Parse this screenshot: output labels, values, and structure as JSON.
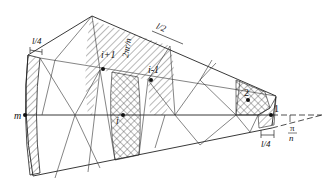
{
  "diagram": {
    "type": "sector-mesh",
    "colors": {
      "line": "#222222",
      "background": "#ffffff"
    },
    "labels": {
      "m": "m",
      "i_plus_1": "i+1",
      "i": "i",
      "i_minus_1": "i-1",
      "two": "2",
      "one": "1",
      "width_l4_left": "l/4",
      "width_l2_top": "l/2",
      "width_l4_bottom": "l/4",
      "arc_length": "2πr/n",
      "angle_num": "π",
      "angle_den": "n"
    },
    "nodes": [
      {
        "id": "m",
        "x": 25,
        "y": 115
      },
      {
        "id": "i+1",
        "x": 103,
        "y": 69
      },
      {
        "id": "i",
        "x": 123,
        "y": 115
      },
      {
        "id": "i-1",
        "x": 151,
        "y": 80
      },
      {
        "id": "2",
        "x": 248,
        "y": 100
      },
      {
        "id": "1",
        "x": 271,
        "y": 115
      }
    ]
  }
}
